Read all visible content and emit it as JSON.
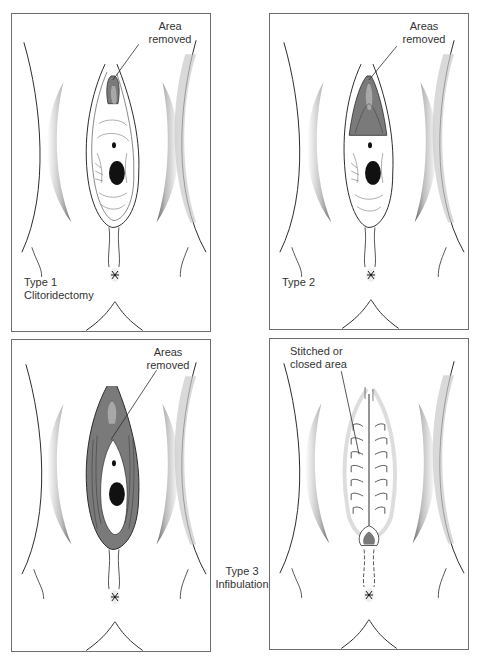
{
  "figure": {
    "panels": [
      {
        "id": "type1",
        "callout": "Area\nremoved",
        "callout_line1": "Area",
        "callout_line2": "removed",
        "type_line1": "Type 1",
        "type_line2": "Clitoridectomy",
        "removed_region": "clitoral hood/clitoris"
      },
      {
        "id": "type2",
        "callout_line1": "Areas",
        "callout_line2": "removed",
        "type_line1": "Type 2",
        "removed_region": "clitoris and labia minora"
      },
      {
        "id": "type3a",
        "callout_line1": "Areas",
        "callout_line2": "removed",
        "removed_region": "clitoris, labia minora and labia majora"
      },
      {
        "id": "type3b",
        "callout_line1": "Stitched or",
        "callout_line2": "closed area",
        "removed_region": "stitched closure"
      }
    ],
    "shared_label": {
      "line1": "Type 3",
      "line2": "Infibulation"
    },
    "colors": {
      "removed_fill": "#7a7a7a",
      "outline": "#2b2b2b",
      "thigh_shade": "#9a9a9a",
      "border": "#6e6e6e"
    }
  }
}
